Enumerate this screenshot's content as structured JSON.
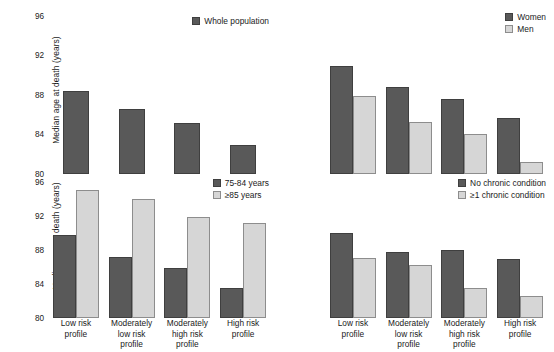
{
  "chart_data": [
    {
      "id": "whole-population",
      "type": "bar",
      "title": "",
      "xlabel": "",
      "ylabel": "Median age at death (years)",
      "ylim": [
        80,
        97
      ],
      "yticks": [
        80,
        84,
        88,
        92,
        96
      ],
      "grid": false,
      "legend_position": "top-right",
      "categories": [
        "Low risk profile",
        "Moderately low risk profile",
        "Moderately high risk profile",
        "High risk profile"
      ],
      "series": [
        {
          "name": "Whole population",
          "color": "#595959",
          "values": [
            88.4,
            86.6,
            85.2,
            82.9
          ]
        }
      ]
    },
    {
      "id": "sex",
      "type": "bar",
      "title": "",
      "xlabel": "",
      "ylabel": "",
      "ylim": [
        80,
        97
      ],
      "yticks": [
        80,
        84,
        88,
        92,
        96
      ],
      "grid": false,
      "legend_position": "top-right",
      "categories": [
        "Low risk profile",
        "Moderately low risk profile",
        "Moderately high risk profile",
        "High risk profile"
      ],
      "series": [
        {
          "name": "Women",
          "color": "#595959",
          "values": [
            90.9,
            88.8,
            87.6,
            85.7
          ]
        },
        {
          "name": "Men",
          "color": "#d6d6d6",
          "values": [
            87.9,
            85.3,
            84.0,
            81.2
          ]
        }
      ]
    },
    {
      "id": "age-group",
      "type": "bar",
      "title": "",
      "xlabel": "",
      "ylabel": "Median age at death (years)",
      "ylim": [
        80,
        97
      ],
      "yticks": [
        80,
        84,
        88,
        92,
        96
      ],
      "grid": false,
      "legend_position": "top-right",
      "categories": [
        "Low risk profile",
        "Moderately low risk profile",
        "Moderately high risk profile",
        "High risk profile"
      ],
      "series": [
        {
          "name": "75-84 years",
          "color": "#595959",
          "values": [
            89.8,
            87.2,
            85.9,
            83.6
          ]
        },
        {
          "name": "≥85 years",
          "color": "#d6d6d6",
          "values": [
            95.1,
            94.1,
            91.9,
            91.2
          ]
        }
      ]
    },
    {
      "id": "chronic-condition",
      "type": "bar",
      "title": "",
      "xlabel": "",
      "ylabel": "",
      "ylim": [
        80,
        97
      ],
      "yticks": [
        80,
        84,
        88,
        92,
        96
      ],
      "grid": false,
      "legend_position": "top-right",
      "categories": [
        "Low risk profile",
        "Moderately low risk profile",
        "Moderately high risk profile",
        "High risk profile"
      ],
      "series": [
        {
          "name": "No chronic condition",
          "color": "#595959",
          "values": [
            90.0,
            87.8,
            88.0,
            87.0
          ]
        },
        {
          "name": "≥1 chronic condition",
          "color": "#d6d6d6",
          "values": [
            87.1,
            86.2,
            83.5,
            82.6
          ]
        }
      ]
    }
  ],
  "axis": {
    "y_title": "Median age at death (years)",
    "ticks": [
      "96",
      "92",
      "88",
      "84",
      "80"
    ]
  },
  "categories_display": [
    [
      "Low risk",
      "profile"
    ],
    [
      "Moderately",
      "low risk",
      "profile"
    ],
    [
      "Moderately",
      "high risk",
      "profile"
    ],
    [
      "High risk",
      "profile"
    ]
  ],
  "legends": {
    "whole_population": [
      "Whole population"
    ],
    "sex": [
      "Women",
      "Men"
    ],
    "age_group": [
      "75-84 years",
      "≥85 years"
    ],
    "chronic": [
      "No chronic condition",
      "≥1 chronic condition"
    ]
  },
  "colors": {
    "dark": "#595959",
    "light": "#d6d6d6",
    "text": "#1a1a1a",
    "background": "#ffffff"
  }
}
